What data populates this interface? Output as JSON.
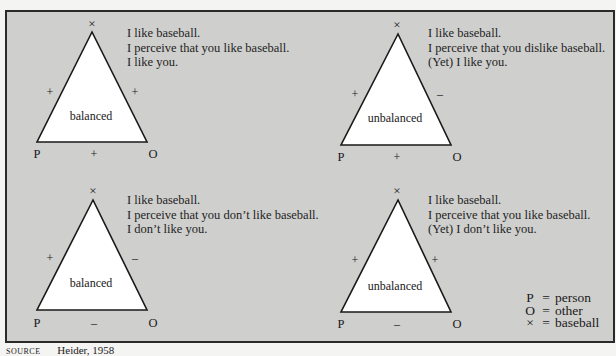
{
  "figure": {
    "legend": [
      {
        "symbol": "P",
        "equals": "=",
        "meaning": "person"
      },
      {
        "symbol": "O",
        "equals": "=",
        "meaning": "other"
      },
      {
        "symbol": "×",
        "equals": "=",
        "meaning": "baseball"
      }
    ],
    "source": {
      "label": "SOURCE",
      "text": "Heider, 1958"
    },
    "vertex_labels": {
      "person": "P",
      "other": "O",
      "object": "×"
    },
    "triangles": [
      {
        "id": "top-left",
        "state": "balanced",
        "signs": {
          "P_x": "+",
          "O_x": "+",
          "P_O": "+"
        },
        "statements": [
          "I like baseball.",
          "I perceive that you like baseball.",
          "I like you."
        ]
      },
      {
        "id": "top-right",
        "state": "unbalanced",
        "signs": {
          "P_x": "+",
          "O_x": "–",
          "P_O": "+"
        },
        "statements": [
          "I like baseball.",
          "I perceive that you dislike baseball.",
          "(Yet) I like you."
        ]
      },
      {
        "id": "bottom-left",
        "state": "balanced",
        "signs": {
          "P_x": "+",
          "O_x": "–",
          "P_O": "–"
        },
        "statements": [
          "I like baseball.",
          "I perceive that you don’t like baseball.",
          "I don’t like you."
        ]
      },
      {
        "id": "bottom-right",
        "state": "unbalanced",
        "signs": {
          "P_x": "+",
          "O_x": "+",
          "P_O": "–"
        },
        "statements": [
          "I like baseball.",
          "I perceive that you like baseball.",
          "(Yet) I don’t like you."
        ]
      }
    ]
  },
  "colors": {
    "panel_bg": "#cfcfcd",
    "triangle_fill": "#ffffff",
    "stroke": "#1a1a1a"
  }
}
